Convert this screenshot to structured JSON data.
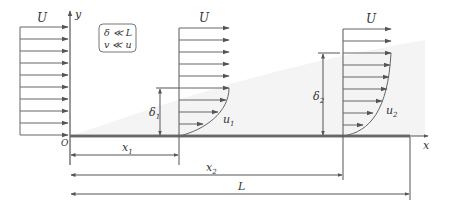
{
  "diagram": {
    "colors": {
      "line": "#555555",
      "arrow": "#666666",
      "plate": "#777777",
      "shade": "#f2f2f2",
      "text": "#333333"
    },
    "labels": {
      "freestream_left": "U",
      "freestream_1": "U",
      "freestream_2": "U",
      "y_axis": "y",
      "x_axis": "x",
      "origin": "O",
      "delta1": "δ",
      "delta1_sub": "1",
      "delta2": "δ",
      "delta2_sub": "2",
      "u1": "u",
      "u1_sub": "1",
      "u2": "u",
      "u2_sub": "2",
      "x1": "x",
      "x1_sub": "1",
      "x2": "x",
      "x2_sub": "2",
      "L": "L"
    },
    "assumptions_box": {
      "line1": "δ ≪ L",
      "line2": "v ≪ u"
    }
  }
}
